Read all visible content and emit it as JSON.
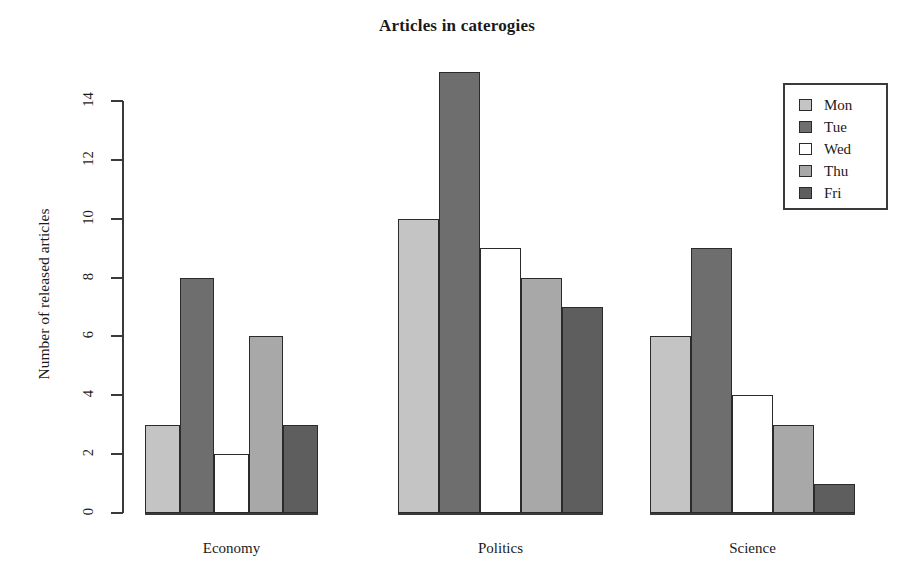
{
  "chart_data": {
    "type": "bar",
    "title": "Articles in caterogies",
    "xlabel": "",
    "ylabel": "Number of released articles",
    "categories": [
      "Economy",
      "Politics",
      "Science"
    ],
    "series": [
      {
        "name": "Mon",
        "values": [
          3,
          10,
          6
        ],
        "color": "#c4c4c4"
      },
      {
        "name": "Tue",
        "values": [
          8,
          15,
          9
        ],
        "color": "#6e6e6e"
      },
      {
        "name": "Wed",
        "values": [
          2,
          9,
          4
        ],
        "color": "#ffffff"
      },
      {
        "name": "Thu",
        "values": [
          6,
          8,
          3
        ],
        "color": "#a8a8a8"
      },
      {
        "name": "Fri",
        "values": [
          3,
          7,
          1
        ],
        "color": "#5e5e5e"
      }
    ],
    "ylim": [
      0,
      15
    ],
    "yticks": [
      0,
      2,
      4,
      6,
      8,
      10,
      12,
      14
    ],
    "ytick_labels": [
      "0",
      "2",
      "4",
      "6",
      "8",
      "10",
      "12",
      "14"
    ],
    "grid": false,
    "grouped": true,
    "legend_position": "top-right",
    "legend_entries": [
      "Mon",
      "Tue",
      "Wed",
      "Thu",
      "Fri"
    ]
  },
  "legend": {
    "items": [
      {
        "label": "Mon",
        "color": "#c4c4c4"
      },
      {
        "label": "Tue",
        "color": "#6e6e6e"
      },
      {
        "label": "Wed",
        "color": "#ffffff"
      },
      {
        "label": "Thu",
        "color": "#a8a8a8"
      },
      {
        "label": "Fri",
        "color": "#5e5e5e"
      }
    ]
  },
  "axes": {
    "y_title": "Number of released articles",
    "y_tick_labels": [
      "0",
      "2",
      "4",
      "6",
      "8",
      "10",
      "12",
      "14"
    ],
    "x_tick_labels": [
      "Economy",
      "Politics",
      "Science"
    ]
  },
  "header": {
    "title": "Articles in caterogies"
  }
}
